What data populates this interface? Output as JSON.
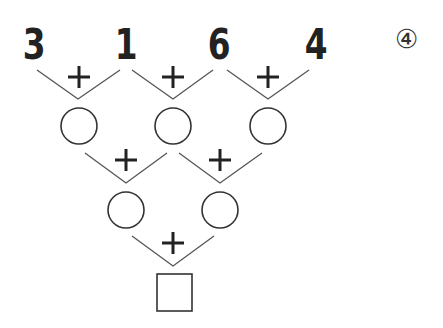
{
  "problem": {
    "label": "④",
    "top_numbers": [
      "3",
      "1",
      "6",
      "4"
    ],
    "operator": "+",
    "row2_circles": 3,
    "row3_circles": 2,
    "answer_box": ""
  },
  "colors": {
    "ink": "#222222",
    "line": "#555555"
  }
}
